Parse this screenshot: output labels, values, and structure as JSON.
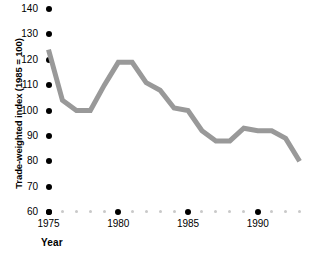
{
  "chart_data": {
    "type": "line",
    "title": "",
    "xlabel": "Year",
    "ylabel": "Trade-weighted index (1985 = 100)",
    "xlim": [
      1975,
      1993
    ],
    "ylim": [
      60,
      140
    ],
    "grid": false,
    "legend": null,
    "line_color": "#999999",
    "x": [
      1975,
      1976,
      1977,
      1978,
      1979,
      1980,
      1981,
      1982,
      1983,
      1984,
      1985,
      1986,
      1987,
      1988,
      1989,
      1990,
      1991,
      1992,
      1993
    ],
    "values": [
      124,
      104,
      100,
      100,
      110,
      119,
      119,
      111,
      108,
      101,
      100,
      92,
      88,
      88,
      93,
      92,
      92,
      89,
      80
    ],
    "y_ticks": [
      140,
      130,
      120,
      110,
      100,
      90,
      80,
      70,
      60
    ],
    "y_tick_labels": [
      "140",
      "130",
      "120",
      "110",
      "100",
      "90",
      "80",
      "70",
      "60"
    ],
    "x_ticks_major": [
      1975,
      1980,
      1985,
      1990
    ],
    "x_tick_labels_major": [
      "1975",
      "1980",
      "1985",
      "1990"
    ],
    "x_ticks_minor": [
      1976,
      1977,
      1978,
      1979,
      1981,
      1982,
      1983,
      1984,
      1986,
      1987,
      1988,
      1989,
      1991,
      1992,
      1993
    ]
  }
}
